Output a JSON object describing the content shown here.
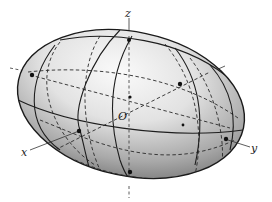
{
  "figure": {
    "labels": {
      "x_axis": "x",
      "y_axis": "y",
      "z_axis": "z",
      "origin": "O"
    },
    "colors": {
      "outline": "#1e1e1e",
      "shade_light": "#f4f4f4",
      "shade_dark": "#8a8a8a",
      "background": "#ffffff"
    },
    "curve_styles": {
      "front_visible": "solid",
      "back_hidden": "dashed"
    }
  }
}
